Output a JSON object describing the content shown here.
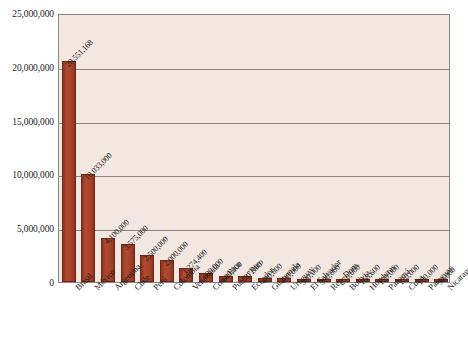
{
  "chart_data": {
    "type": "bar",
    "title": "",
    "subtitle": "",
    "xlabel": "",
    "ylabel": "",
    "ylim": [
      0,
      25000000
    ],
    "grid": true,
    "legend": false,
    "orientation": "vertical",
    "bar_color": "#a8432b",
    "plot_background": "#f3e7e2",
    "axis_color": "#8d8581",
    "y_ticks": [
      0,
      5000000,
      10000000,
      15000000,
      20000000,
      25000000
    ],
    "y_tick_labels": [
      "0",
      "5,000,000",
      "10,000,000",
      "15,000,000",
      "20,000,000",
      "25,000,000"
    ],
    "categories": [
      "Brasil",
      "México",
      "Argentina",
      "Chile",
      "Perú",
      "Colombia",
      "Venezuela",
      "Costa Rica",
      "Puerto Rico",
      "Ecuador",
      "Guatemala",
      "Uruguay",
      "El Salvador",
      "Rep. Dom.",
      "Bolivia",
      "Honduras",
      "Panamá",
      "Cuba",
      "Paraguay",
      "Nicaragua"
    ],
    "values": [
      20551168,
      10033000,
      4100000,
      3575000,
      2500000,
      2000000,
      1274400,
      800000,
      600000,
      537900,
      400000,
      400000,
      300000,
      300000,
      270000,
      168600,
      120000,
      120000,
      100000,
      90000
    ],
    "data_labels": [
      "20,551,168",
      "10,033,000",
      "4,100,000",
      "3,575,000",
      "2,500,000",
      "2,000,000",
      "1,274,400",
      "800,000",
      "600,000",
      "537,900",
      "400,000",
      "400,000",
      "300,000",
      "300,000",
      "270,000",
      "168,600",
      "120,000",
      "120,000",
      "100,000",
      "90,000"
    ]
  }
}
